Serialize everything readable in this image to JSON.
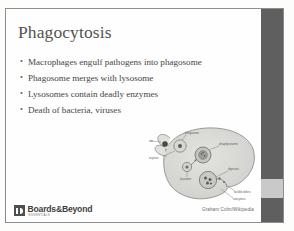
{
  "slide": {
    "title": "Phagocytosis",
    "bullet_marker": "•",
    "bullets": [
      {
        "text": "Macrophages engulf pathogens into phagosome"
      },
      {
        "text": "Phagosome merges with lysosome"
      },
      {
        "text": "Lysosomes contain deadly enzymes"
      },
      {
        "text": "Death of bacteria, viruses"
      }
    ],
    "accent_dark": "#5f5f5f",
    "accent_light": "#c9c9c9",
    "title_color": "#55544f",
    "body_color": "#46453f"
  },
  "diagram": {
    "name": "phagocytosis-macrophage-diagram",
    "credit": "Graham Colm/Wikipedia",
    "labels": [
      {
        "text": "bacterium"
      },
      {
        "text": "phagosome"
      },
      {
        "text": "phagocytosis"
      },
      {
        "text": "phagolysosome"
      },
      {
        "text": "lysosome"
      },
      {
        "text": "digestion"
      },
      {
        "text": "soluble debris"
      },
      {
        "text": "exocytosis"
      }
    ]
  },
  "footer": {
    "logo_wordmark": "Boards&Beyond",
    "logo_subtext": "ESSENTIALS"
  }
}
